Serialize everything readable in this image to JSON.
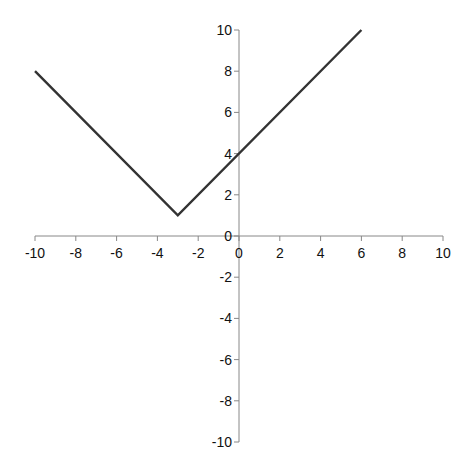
{
  "chart_data": {
    "type": "line",
    "title": "",
    "xlabel": "",
    "ylabel": "",
    "xlim": [
      -10,
      10
    ],
    "ylim": [
      -10,
      10
    ],
    "grid": false,
    "legend": null,
    "x_ticks": [
      -10,
      -8,
      -6,
      -4,
      -2,
      0,
      2,
      4,
      6,
      8,
      10
    ],
    "y_ticks": [
      -10,
      -8,
      -6,
      -4,
      -2,
      0,
      2,
      4,
      6,
      8,
      10
    ],
    "series": [
      {
        "name": "y = |x + 3| + 1",
        "x": [
          -10,
          -3,
          6
        ],
        "y": [
          8,
          1,
          10
        ],
        "color": "#333333"
      }
    ]
  },
  "layout": {
    "axis_color": "#888888",
    "line_color": "#333333"
  }
}
